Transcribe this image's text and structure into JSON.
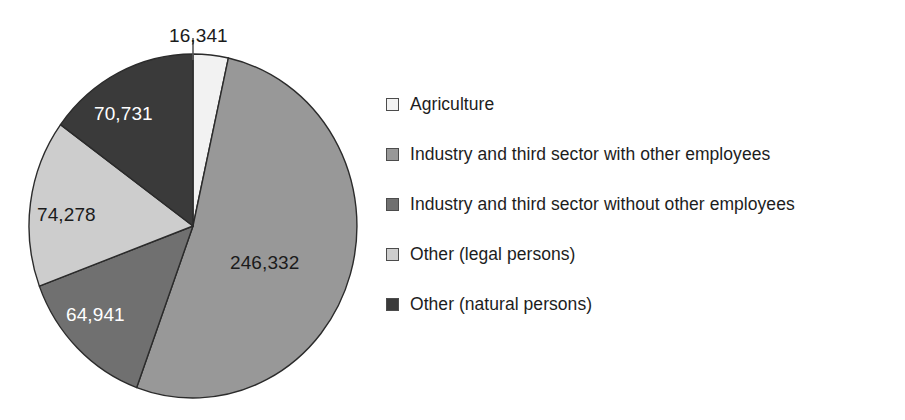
{
  "chart_data": {
    "type": "pie",
    "title": "",
    "subtitle": "",
    "xlabel": "",
    "ylabel": "",
    "grid": false,
    "legend_position": "right",
    "start_angle_deg": 0,
    "direction": "clockwise",
    "total": 472623,
    "categories": [
      "Agriculture",
      "Industry and third sector with other employees",
      "Industry and third sector without other employees",
      "Other (legal persons)",
      "Other (natural persons)"
    ],
    "values": [
      16341,
      246332,
      64941,
      74278,
      70731
    ],
    "value_labels": [
      "16,341",
      "246,332",
      "64,941",
      "74,278",
      "70,731"
    ],
    "colors": [
      "#f2f2f2",
      "#989898",
      "#707070",
      "#cdcdcd",
      "#3a3a3a"
    ],
    "slices": [
      {
        "label": "Agriculture",
        "value": 16341,
        "value_label": "16,341",
        "color": "#f2f2f2",
        "label_color": "dark",
        "has_leader_line": true
      },
      {
        "label": "Industry and third sector with other employees",
        "value": 246332,
        "value_label": "246,332",
        "color": "#989898",
        "label_color": "dark",
        "has_leader_line": false
      },
      {
        "label": "Industry and third sector without other employees",
        "value": 64941,
        "value_label": "64,941",
        "color": "#707070",
        "label_color": "light",
        "has_leader_line": false
      },
      {
        "label": "Other (legal persons)",
        "value": 74278,
        "value_label": "74,278",
        "color": "#cdcdcd",
        "label_color": "dark",
        "has_leader_line": false
      },
      {
        "label": "Other (natural persons)",
        "value": 70731,
        "value_label": "70,731",
        "color": "#3a3a3a",
        "label_color": "light",
        "has_leader_line": false
      }
    ]
  },
  "legend": {
    "items": [
      {
        "label": "Agriculture",
        "color": "#f2f2f2"
      },
      {
        "label": "Industry and third sector with other employees",
        "color": "#989898"
      },
      {
        "label": "Industry and third sector without other employees",
        "color": "#707070"
      },
      {
        "label": "Other (legal persons)",
        "color": "#cdcdcd"
      },
      {
        "label": "Other (natural persons)",
        "color": "#3a3a3a"
      }
    ]
  },
  "style": {
    "background": "#ffffff",
    "slice_outline": "#2b2b2b",
    "text_color": "#1d1d1d",
    "label_light": "#ffffff"
  }
}
